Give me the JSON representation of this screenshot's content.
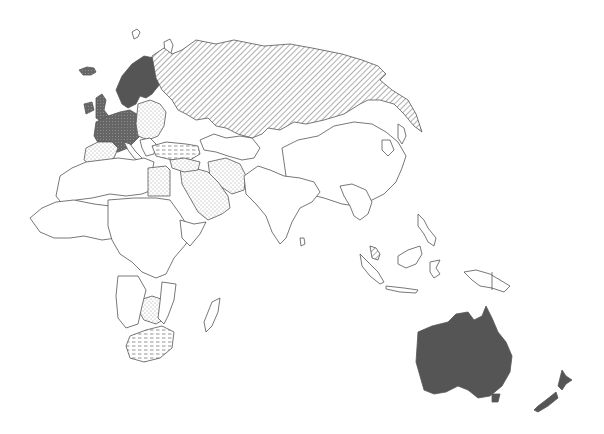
{
  "map": {
    "title": "",
    "projection": "Eastern hemisphere outline map (Europe, Africa, Asia, Oceania)",
    "colors": {
      "background": "#ffffff",
      "outline": "#555555",
      "solid": "#555555",
      "hatch": "#777777",
      "dots": "#999999",
      "dashes": "#888888",
      "none": "#ffffff"
    },
    "fill_categories": [
      {
        "id": "solid",
        "description": "solid dark fill"
      },
      {
        "id": "diagonal",
        "description": "diagonal hatching"
      },
      {
        "id": "dotted",
        "description": "light dot stipple"
      },
      {
        "id": "dashed",
        "description": "horizontal dash pattern"
      },
      {
        "id": "crosshatch",
        "description": "dark cross-hatch"
      },
      {
        "id": "none",
        "description": "no fill (outline only)"
      }
    ],
    "regions": [
      {
        "name": "Scandinavia",
        "fill": "solid"
      },
      {
        "name": "Western Europe",
        "fill": "crosshatch"
      },
      {
        "name": "British Isles",
        "fill": "crosshatch"
      },
      {
        "name": "Russia / Soviet Union",
        "fill": "diagonal"
      },
      {
        "name": "Eastern Europe",
        "fill": "dotted"
      },
      {
        "name": "Turkey",
        "fill": "dashed"
      },
      {
        "name": "Middle East / Arabia",
        "fill": "dotted"
      },
      {
        "name": "Iran",
        "fill": "dotted"
      },
      {
        "name": "Egypt",
        "fill": "dotted"
      },
      {
        "name": "Iberia",
        "fill": "dotted"
      },
      {
        "name": "Southern Africa (Zimbabwe/Botswana area)",
        "fill": "dotted"
      },
      {
        "name": "South Africa",
        "fill": "dashed"
      },
      {
        "name": "Malaysia (peninsula)",
        "fill": "diagonal"
      },
      {
        "name": "Australia",
        "fill": "solid"
      },
      {
        "name": "New Zealand",
        "fill": "solid"
      },
      {
        "name": "Rest of Africa",
        "fill": "none"
      },
      {
        "name": "China / Mongolia",
        "fill": "none"
      },
      {
        "name": "South Asia",
        "fill": "none"
      },
      {
        "name": "Southeast Asia",
        "fill": "none"
      },
      {
        "name": "Indonesia / Papua New Guinea",
        "fill": "none"
      }
    ]
  }
}
